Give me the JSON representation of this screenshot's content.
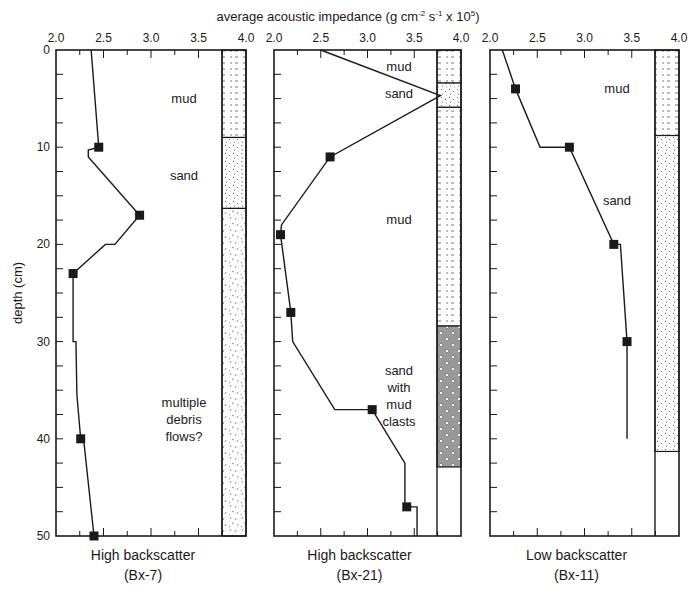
{
  "chart_data": {
    "type": "line",
    "xlabel": "average acoustic impedance (g cm-2 s-1 x 10^5)",
    "ylabel": "depth (cm)",
    "xlim": [
      2.0,
      4.0
    ],
    "ylim": [
      0,
      50
    ],
    "y_inverted": true,
    "x_ticks": [
      "2.0",
      "2.5",
      "3.0",
      "3.5",
      "4.0"
    ],
    "y_ticks": [
      "0",
      "10",
      "20",
      "30",
      "40",
      "50"
    ],
    "grid": false,
    "legend": null,
    "panels": [
      {
        "id": "Bx-7",
        "caption_line1": "High backscatter",
        "caption_line2": "(Bx-7)",
        "line": [
          [
            2.37,
            0
          ],
          [
            2.45,
            10
          ],
          [
            2.34,
            10.3
          ],
          [
            2.34,
            11
          ],
          [
            2.88,
            17
          ],
          [
            2.62,
            20
          ],
          [
            2.52,
            20
          ],
          [
            2.18,
            23
          ],
          [
            2.18,
            30
          ],
          [
            2.21,
            30
          ],
          [
            2.22,
            35.5
          ],
          [
            2.26,
            40
          ],
          [
            2.29,
            40
          ],
          [
            2.4,
            50
          ]
        ],
        "markers": [
          [
            2.45,
            10
          ],
          [
            2.88,
            17
          ],
          [
            2.18,
            23
          ],
          [
            2.26,
            40
          ],
          [
            2.4,
            50
          ]
        ],
        "lithology": [
          {
            "label": "mud",
            "top": 0,
            "bottom": 9,
            "pattern": "mud",
            "label_depth": 5
          },
          {
            "label": "sand",
            "top": 9,
            "bottom": 16.3,
            "pattern": "sand",
            "label_depth": 13
          },
          {
            "label": "multiple debris flows?",
            "top": 16.3,
            "bottom": 50,
            "pattern": "debris",
            "label_depth": 38
          }
        ]
      },
      {
        "id": "Bx-21",
        "caption_line1": "High backscatter",
        "caption_line2": "(Bx-21)",
        "line": [
          [
            2.5,
            0
          ],
          [
            3.78,
            4.7
          ],
          [
            2.6,
            11
          ],
          [
            2.08,
            18
          ],
          [
            2.07,
            19
          ],
          [
            2.18,
            27
          ],
          [
            2.2,
            30
          ],
          [
            2.65,
            37
          ],
          [
            3.05,
            37
          ],
          [
            3.4,
            42.5
          ],
          [
            3.4,
            47
          ],
          [
            3.53,
            47
          ],
          [
            3.53,
            50
          ]
        ],
        "markers": [
          [
            2.6,
            11
          ],
          [
            2.07,
            19
          ],
          [
            2.18,
            27
          ],
          [
            3.05,
            37
          ],
          [
            3.42,
            47
          ]
        ],
        "lithology": [
          {
            "label": "mud",
            "top": 0,
            "bottom": 3.4,
            "pattern": "mud",
            "label_depth": 1.8
          },
          {
            "label": "sand",
            "top": 3.4,
            "bottom": 5.9,
            "pattern": "sand",
            "label_depth": 4.5
          },
          {
            "label": "mud",
            "top": 5.9,
            "bottom": 28.4,
            "pattern": "mud",
            "label_depth": 17.5
          },
          {
            "label": "sand with mud clasts",
            "top": 28.4,
            "bottom": 42.9,
            "pattern": "clasts",
            "label_depth": 35.5
          }
        ]
      },
      {
        "id": "Bx-11",
        "caption_line1": "Low backscatter",
        "caption_line2": "(Bx-11)",
        "line": [
          [
            2.13,
            0
          ],
          [
            2.27,
            4
          ],
          [
            2.53,
            10
          ],
          [
            2.84,
            10
          ],
          [
            3.31,
            20
          ],
          [
            3.38,
            20
          ],
          [
            3.45,
            30
          ],
          [
            3.45,
            40
          ]
        ],
        "markers": [
          [
            2.27,
            4
          ],
          [
            2.84,
            10
          ],
          [
            3.31,
            20
          ],
          [
            3.45,
            30
          ]
        ],
        "lithology": [
          {
            "label": "mud",
            "top": 0,
            "bottom": 8.8,
            "pattern": "mud",
            "label_depth": 4
          },
          {
            "label": "sand",
            "top": 8.8,
            "bottom": 41.3,
            "pattern": "sand",
            "label_depth": 15.5
          }
        ]
      }
    ]
  },
  "labels": {
    "x_axis_title": "average acoustic impedance (g cm",
    "x_axis_sup1": "-2",
    "x_axis_mid": " s",
    "x_axis_sup2": "-1",
    "x_axis_tail": " x 10",
    "x_axis_sup3": "5",
    "x_axis_close": ")",
    "y_axis_title": "depth (cm)"
  },
  "colors": {
    "ink": "#1a1a1a",
    "clast_fill": "#9a9a9a",
    "background": "#ffffff"
  }
}
